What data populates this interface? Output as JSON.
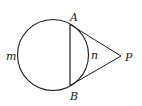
{
  "diagram": {
    "type": "geometry",
    "stroke_color": "#1a1a1a",
    "background": "#ffffff",
    "circle": {
      "cx": 53,
      "cy": 55,
      "r": 35.5
    },
    "points": {
      "A": {
        "x": 70,
        "y": 24.5,
        "label": "A"
      },
      "B": {
        "x": 70,
        "y": 85.5,
        "label": "B"
      },
      "P": {
        "x": 121,
        "y": 56,
        "label": "P"
      }
    },
    "arcs": {
      "major": {
        "label": "m"
      },
      "minor": {
        "label": "n"
      }
    },
    "segments": [
      "AB",
      "AP",
      "BP"
    ]
  }
}
